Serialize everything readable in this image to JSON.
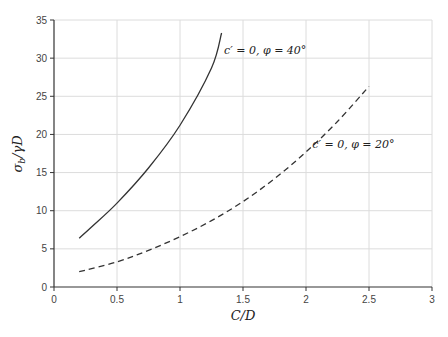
{
  "chart_data": {
    "type": "line",
    "title": "",
    "xlabel": "C/D",
    "ylabel": "σ_b/γD",
    "xlim": [
      0,
      3
    ],
    "ylim": [
      0,
      35
    ],
    "xticks": [
      "0",
      "0.5",
      "1",
      "1.5",
      "2",
      "2.5",
      "3"
    ],
    "yticks": [
      "0",
      "5",
      "10",
      "15",
      "20",
      "25",
      "30",
      "35"
    ],
    "grid": true,
    "legend": "none (inline annotations)",
    "series": [
      {
        "name": "c' = 0, φ = 40°",
        "style": "solid",
        "x": [
          0.2,
          0.3,
          0.5,
          0.75,
          1.0,
          1.25,
          1.33
        ],
        "y": [
          6.4,
          7.9,
          11.0,
          15.6,
          21.2,
          28.7,
          33.3
        ]
      },
      {
        "name": "c' = 0, φ = 20°",
        "style": "dashed",
        "x": [
          0.2,
          0.5,
          0.75,
          1.0,
          1.25,
          1.5,
          1.75,
          2.0,
          2.25,
          2.5
        ],
        "y": [
          2.0,
          3.3,
          4.8,
          6.6,
          8.7,
          11.2,
          14.2,
          17.7,
          21.7,
          26.3
        ]
      }
    ],
    "annotations": [
      {
        "text": "c′ = 0, φ = 40°",
        "x": 1.35,
        "y": 30.5
      },
      {
        "text": "c′ = 0, φ = 20°",
        "x": 2.05,
        "y": 18.2
      }
    ]
  }
}
